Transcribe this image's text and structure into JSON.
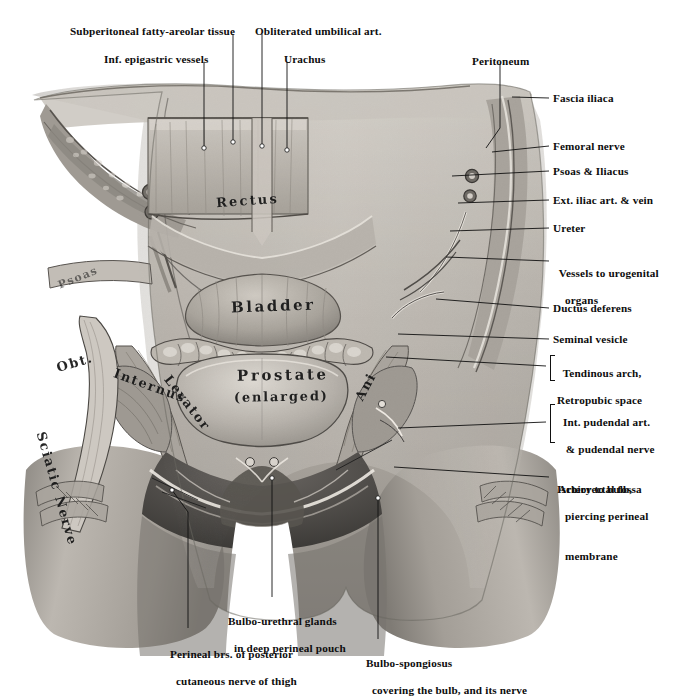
{
  "figure": {
    "kind": "anatomical-illustration",
    "background_color": "#ffffff",
    "ink_color": "#111111"
  },
  "labels_top": [
    {
      "id": "subperitoneal",
      "text": "Subperitoneal fatty-areolar tissue",
      "x": 70,
      "y": 26,
      "anchor": "start"
    },
    {
      "id": "obliterated_umbilical",
      "text": "Obliterated umbilical art.",
      "x": 258,
      "y": 26,
      "anchor": "start"
    },
    {
      "id": "inf_epigastric",
      "text": "Inf. epigastric vessels",
      "x": 104,
      "y": 54,
      "anchor": "start"
    },
    {
      "id": "urachus",
      "text": "Urachus",
      "x": 284,
      "y": 54,
      "anchor": "start"
    },
    {
      "id": "peritoneum",
      "text": "Peritoneum",
      "x": 472,
      "y": 56,
      "anchor": "start"
    }
  ],
  "labels_right": [
    {
      "id": "fascia_iliaca",
      "text": "Fascia iliaca",
      "x": 553,
      "y": 92,
      "lines": [
        "Fascia iliaca"
      ]
    },
    {
      "id": "femoral_nerve",
      "text": "Femoral nerve",
      "x": 553,
      "y": 140,
      "lines": [
        "Femoral nerve"
      ]
    },
    {
      "id": "psoas_iliacus",
      "text": "Psoas & Iliacus",
      "x": 553,
      "y": 165,
      "lines": [
        "Psoas & Iliacus"
      ]
    },
    {
      "id": "ext_iliac",
      "text": "Ext. iliac art. & vein",
      "x": 553,
      "y": 194,
      "lines": [
        "Ext. iliac art. & vein"
      ]
    },
    {
      "id": "ureter",
      "text": "Ureter",
      "x": 553,
      "y": 222,
      "lines": [
        "Ureter"
      ]
    },
    {
      "id": "vessels_urogenital",
      "text": "Vessels to urogenital organs",
      "x": 553,
      "y": 255,
      "lines": [
        "Vessels to urogenital",
        "organs"
      ]
    },
    {
      "id": "ductus_deferens",
      "text": "Ductus deferens",
      "x": 553,
      "y": 302,
      "lines": [
        "Ductus deferens"
      ]
    },
    {
      "id": "seminal_vesicle",
      "text": "Seminal vesicle",
      "x": 553,
      "y": 333,
      "lines": [
        "Seminal vesicle"
      ]
    }
  ],
  "labels_right_bracketed": [
    {
      "id": "tendinous_arch_group",
      "x": 558,
      "y": 355,
      "bracket": {
        "x": 550,
        "y": 355,
        "height": 24
      },
      "lines": [
        "Tendinous arch,",
        "Retropubic space"
      ]
    },
    {
      "id": "pudendal_group",
      "x": 558,
      "y": 404,
      "bracket": {
        "x": 550,
        "y": 404,
        "height": 36
      },
      "lines": [
        "Int. pudendal art.",
        "   & pudendal nerve",
        "Ischiorectal fossa"
      ]
    }
  ],
  "labels_right_multiline": [
    {
      "id": "artery_to_bulb",
      "x": 553,
      "y": 471,
      "lines": [
        "Artery to bulb,",
        "piercing perineal",
        "membrane"
      ],
      "indent": [
        0,
        1,
        1
      ]
    }
  ],
  "labels_bottom": [
    {
      "id": "bulbo_urethral_glands",
      "x": 222,
      "y": 603,
      "lines": [
        "Bulbo-urethral glands",
        "in deep perineal pouch"
      ],
      "indent": [
        0,
        1
      ]
    },
    {
      "id": "perineal_branches",
      "x": 164,
      "y": 636,
      "lines": [
        "Perineal brs. of posterior",
        "cutaneous nerve of thigh"
      ],
      "indent": [
        0,
        1
      ]
    },
    {
      "id": "bulbo_spongiosus",
      "x": 360,
      "y": 645,
      "lines": [
        "Bulbo-spongiosus",
        "covering the bulb, and its nerve"
      ],
      "indent": [
        0,
        1
      ]
    }
  ],
  "in_figure_labels": [
    {
      "id": "rectus",
      "text": "Rectus",
      "x": 216,
      "y": 200,
      "size": 13,
      "rotate": -4,
      "spacing": 2.2
    },
    {
      "id": "psoas_hand",
      "text": "Psoas",
      "x": 57,
      "y": 277,
      "size": 11,
      "rotate": -22,
      "spacing": 1.4,
      "faint": true
    },
    {
      "id": "bladder",
      "text": "Bladder",
      "x": 233,
      "y": 305,
      "size": 15,
      "rotate": -2,
      "spacing": 2.6
    },
    {
      "id": "obt",
      "text": "Obt.",
      "x": 58,
      "y": 362,
      "size": 13,
      "rotate": -16,
      "spacing": 1.6
    },
    {
      "id": "internus",
      "text": "Internus",
      "x": 112,
      "y": 385,
      "size": 13,
      "rotate": 20,
      "spacing": 1.6
    },
    {
      "id": "sciatic_nerve",
      "text": "Sciatic Nerve",
      "x": 86,
      "y": 430,
      "size": 13,
      "rotate": -74,
      "spacing": 1.6
    },
    {
      "id": "prostate",
      "text": "Prostate",
      "x": 239,
      "y": 373,
      "size": 15,
      "rotate": -1,
      "spacing": 2.6
    },
    {
      "id": "enlarged",
      "text": "(enlarged)",
      "x": 236,
      "y": 396,
      "size": 13,
      "rotate": -1,
      "spacing": 1.8
    },
    {
      "id": "levator",
      "text": "Levator",
      "x": 175,
      "y": 378,
      "size": 13,
      "rotate": 52,
      "spacing": 1.6
    },
    {
      "id": "ani",
      "text": "Ani",
      "x": 352,
      "y": 400,
      "size": 13,
      "rotate": -62,
      "spacing": 1.6
    }
  ],
  "leader_lines": {
    "top": [
      {
        "id": "subperitoneal-leader",
        "path": "M 233,34 L 233,142"
      },
      {
        "id": "obliterated-leader",
        "path": "M 262,34 L 262,146"
      },
      {
        "id": "inf-epigastric-leader",
        "path": "M 204,62 L 204,148"
      },
      {
        "id": "urachus-leader",
        "path": "M 287,62 L 287,150"
      },
      {
        "id": "peritoneum-leader",
        "path": "M 500,64 L 500,130 L 487,146"
      }
    ],
    "right": [
      {
        "id": "fascia-iliaca-leader",
        "path": "M 549,98 L 512,98"
      },
      {
        "id": "femoral-nerve-leader",
        "path": "M 549,146 L 497,150"
      },
      {
        "id": "psoas-iliacus-leader",
        "path": "M 549,171 L 455,174"
      },
      {
        "id": "ext-iliac-leader",
        "path": "M 549,200 L 460,203"
      },
      {
        "id": "ureter-leader",
        "path": "M 549,228 L 452,230"
      },
      {
        "id": "vessels-leader",
        "path": "M 549,261 L 447,258"
      },
      {
        "id": "ductus-leader",
        "path": "M 549,308 L 437,300"
      },
      {
        "id": "seminal-leader",
        "path": "M 549,339 L 400,333"
      },
      {
        "id": "tendinous-leader",
        "path": "M 546,366 L 388,358"
      },
      {
        "id": "pudendal-leader",
        "path": "M 546,422 L 400,428"
      },
      {
        "id": "artery-bulb-leader",
        "path": "M 549,477 L 397,468"
      }
    ],
    "bottom": [
      {
        "id": "bulbo-urethral-leader",
        "path": "M 272,597 L 272,480"
      },
      {
        "id": "perineal-brs-leader",
        "path": "M 188,628 L 188,510 L 175,492"
      },
      {
        "id": "bulbo-spongiosus-leader",
        "path": "M 378,639 L 378,496"
      }
    ]
  }
}
